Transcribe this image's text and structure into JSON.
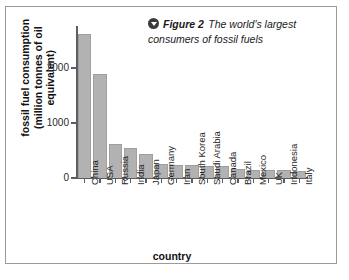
{
  "figure": {
    "caption_icon": "circle-chevron-down-icon",
    "caption_label": "Figure 2",
    "caption_text": "The world's largest consumers of fossil fuels"
  },
  "chart_data": {
    "type": "bar",
    "title": "The world's largest consumers of fossil fuels",
    "xlabel": "country",
    "ylabel": "fossil fuel consumption (million tonnes of oil equivalent)",
    "ylabel_line1": "fossil fuel consumption",
    "ylabel_line2": "(million tonnes of oil equivalent)",
    "ylim": [
      0,
      2750
    ],
    "yticks": [
      0,
      1000,
      2000
    ],
    "ytick_labels": [
      "0",
      "1000",
      "2000"
    ],
    "grid": false,
    "legend": "none",
    "bar_color": "#b2b2b2",
    "axis_color": "#5d5d5d",
    "categories": [
      "China",
      "USA",
      "Russia",
      "India",
      "Japan",
      "Germany",
      "Iran",
      "South Korea",
      "Saudi Arabia",
      "Canada",
      "Brazil",
      "Mexico",
      "UK",
      "Indonesia",
      "Italy"
    ],
    "values": [
      2630,
      1890,
      620,
      550,
      440,
      260,
      230,
      230,
      220,
      215,
      160,
      155,
      150,
      150,
      120
    ]
  }
}
